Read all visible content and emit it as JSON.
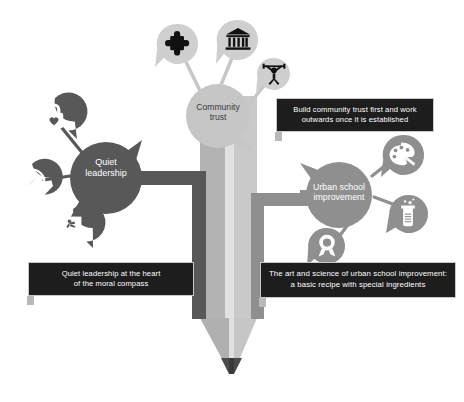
{
  "diagram": {
    "type": "mind-map",
    "title_pencil": "pencil-graphic",
    "background_color": "#ffffff",
    "palette": {
      "light_gray": "#c6c6c6",
      "mid_gray": "#8f8f8f",
      "dark_gray": "#585858",
      "pencil_body_light": "#d4d4d4",
      "pencil_body_shade": "#a8a8a8",
      "pencil_tip": "#4a4a4a",
      "caption_bg": "#1d1d1d",
      "caption_border": "#c9c9c9",
      "icon_glyph": "#111111"
    },
    "nodes": [
      {
        "id": "community-trust",
        "label": "Community\ntrust",
        "label_color": "#3b3b3b",
        "fill": "#c6c6c6",
        "icons": [
          "puzzle-piece-icon",
          "bank-building-icon",
          "weightlifter-icon"
        ]
      },
      {
        "id": "quiet-leadership",
        "label": "Quiet\nleadership",
        "label_color": "#ffffff",
        "fill": "#585858",
        "icons": [
          "padlock-heart-icon",
          "compass-icon",
          "flag-icon"
        ]
      },
      {
        "id": "urban-school-improvement",
        "label": "Urban school\nimprovement",
        "label_color": "#ffffff",
        "fill": "#8f8f8f",
        "icons": [
          "paint-palette-icon",
          "beaker-icon",
          "award-rosette-icon"
        ]
      }
    ],
    "captions": [
      {
        "id": "caption-community-trust",
        "text": "Build community trust first and work\noutwards once it is established"
      },
      {
        "id": "caption-quiet-leadership",
        "text": "Quiet leadership at the heart\nof the moral compass"
      },
      {
        "id": "caption-urban-school-improvement",
        "text": "The art and science of urban school improvement:\na basic recipe with special ingredients"
      }
    ]
  }
}
